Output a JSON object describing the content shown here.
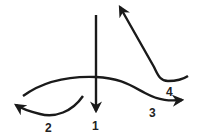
{
  "diagram": {
    "stroke_color": "#1a1a1a",
    "arrows": [
      {
        "id": "1",
        "label": "1",
        "description": "vertical arrow pointing down"
      },
      {
        "id": "2",
        "label": "2",
        "description": "short curved arrow pointing left"
      },
      {
        "id": "3",
        "label": "3",
        "description": "long wave curve arrow pointing right"
      },
      {
        "id": "4",
        "label": "4",
        "description": "J-shaped curve arrow pointing up-left"
      }
    ]
  }
}
